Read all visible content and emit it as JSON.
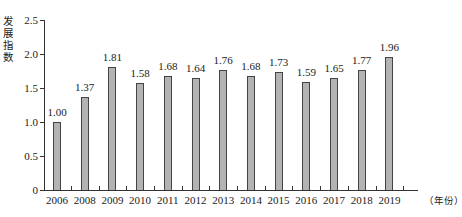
{
  "chart_data": {
    "type": "bar",
    "title": "",
    "xlabel": "（年份）",
    "ylabel": "发展指数",
    "ylim": [
      0,
      2.5
    ],
    "yticks": [
      "0",
      "0.5",
      "1.0",
      "1.5",
      "2.0",
      "2.5"
    ],
    "grid": false,
    "categories": [
      "2006",
      "2008",
      "2009",
      "2010",
      "2011",
      "2012",
      "2013",
      "2014",
      "2015",
      "2016",
      "2017",
      "2018",
      "2019"
    ],
    "values": [
      1.0,
      1.37,
      1.81,
      1.58,
      1.68,
      1.64,
      1.76,
      1.68,
      1.73,
      1.59,
      1.65,
      1.77,
      1.96
    ],
    "value_labels": [
      "1.00",
      "1.37",
      "1.81",
      "1.58",
      "1.68",
      "1.64",
      "1.76",
      "1.68",
      "1.73",
      "1.59",
      "1.65",
      "1.77",
      "1.96"
    ],
    "bar_color": "#b3b3b3",
    "edge_color": "#444444"
  }
}
